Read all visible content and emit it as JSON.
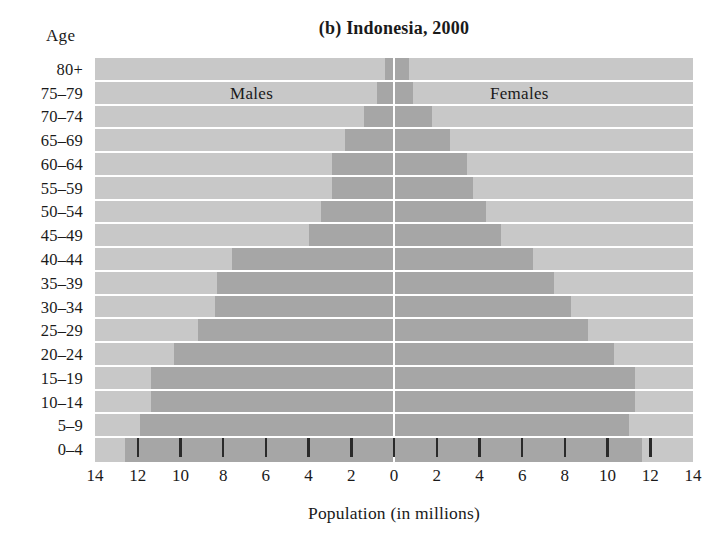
{
  "chart_data": {
    "type": "bar",
    "subtype": "population-pyramid",
    "title": "(b) Indonesia, 2000",
    "xlabel": "Population (in millions)",
    "ylabel": "Age",
    "xlim": [
      -14,
      14
    ],
    "xticks": [
      14,
      12,
      10,
      8,
      6,
      4,
      2,
      0,
      2,
      4,
      6,
      8,
      10,
      12,
      14
    ],
    "xtick_labels": [
      "14",
      "12",
      "10",
      "8",
      "6",
      "4",
      "2",
      "0",
      "2",
      "4",
      "6",
      "8",
      "10",
      "12",
      "14"
    ],
    "grid": true,
    "legend_position": "inside-top",
    "categories": [
      "80+",
      "75–79",
      "70–74",
      "65–69",
      "60–64",
      "55–59",
      "50–54",
      "45–49",
      "40–44",
      "35–39",
      "30–34",
      "25–29",
      "20–24",
      "15–19",
      "10–14",
      "5–9",
      "0–4"
    ],
    "series": [
      {
        "name": "Males",
        "side": "left",
        "color": "#a6a6a6",
        "values": [
          0.4,
          0.8,
          1.4,
          2.3,
          2.9,
          2.9,
          3.4,
          4.0,
          7.6,
          8.3,
          8.4,
          9.2,
          10.3,
          11.4,
          11.4,
          11.9,
          12.6
        ]
      },
      {
        "name": "Females",
        "side": "right",
        "color": "#a6a6a6",
        "values": [
          0.7,
          0.9,
          1.8,
          2.6,
          3.4,
          3.7,
          4.3,
          5.0,
          6.5,
          7.5,
          8.3,
          9.1,
          10.3,
          11.3,
          11.3,
          11.0,
          11.6
        ]
      }
    ],
    "colors": {
      "bar": "#a6a6a6",
      "plot_background": "#c8c8c8",
      "gridline": "#ffffff",
      "axis_line": "#ffffff",
      "tick_mark": "#2a2a2a",
      "text": "#1a1a1a",
      "page_background": "#ffffff"
    }
  }
}
